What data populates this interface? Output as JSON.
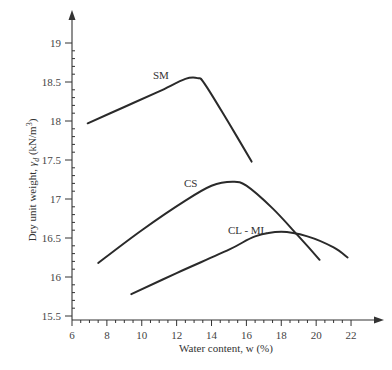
{
  "chart_data": {
    "type": "line",
    "title": "",
    "xlabel": "Water content, w (%)",
    "ylabel": "Dry unit weight, γd (kN/m³)",
    "ylabel_parts": {
      "prefix": "Dry unit weight, ",
      "symbol": "γ",
      "subscript": "d",
      "unit_open": " (kN/m",
      "unit_sup": "3",
      "unit_close": ")"
    },
    "xlim": [
      6,
      23
    ],
    "ylim": [
      15.5,
      19.4
    ],
    "x_ticks": [
      "6",
      "8",
      "10",
      "12",
      "14",
      "16",
      "18",
      "20",
      "22"
    ],
    "y_ticks": [
      "15.5",
      "16",
      "16.5",
      "17",
      "17.5",
      "18",
      "18.5",
      "19"
    ],
    "grid": false,
    "legend": "inline labels",
    "series": [
      {
        "name": "SM",
        "points": [
          [
            6.9,
            17.97
          ],
          [
            9,
            18.18
          ],
          [
            11,
            18.38
          ],
          [
            12.5,
            18.54
          ],
          [
            13.2,
            18.55
          ],
          [
            13.6,
            18.48
          ],
          [
            15,
            17.97
          ],
          [
            16.3,
            17.48
          ]
        ]
      },
      {
        "name": "CS",
        "points": [
          [
            7.5,
            16.18
          ],
          [
            10,
            16.6
          ],
          [
            12.5,
            16.98
          ],
          [
            14,
            17.17
          ],
          [
            15.2,
            17.22
          ],
          [
            16,
            17.17
          ],
          [
            17.5,
            16.88
          ],
          [
            19,
            16.52
          ],
          [
            20.2,
            16.22
          ]
        ]
      },
      {
        "name": "CL - ML",
        "points": [
          [
            9.4,
            15.78
          ],
          [
            12,
            16.05
          ],
          [
            15,
            16.35
          ],
          [
            16.5,
            16.52
          ],
          [
            18,
            16.58
          ],
          [
            19.5,
            16.52
          ],
          [
            21,
            16.38
          ],
          [
            21.8,
            16.25
          ]
        ]
      }
    ]
  },
  "labels": {
    "sm": "SM",
    "cs": "CS",
    "clml": "CL - ML"
  }
}
